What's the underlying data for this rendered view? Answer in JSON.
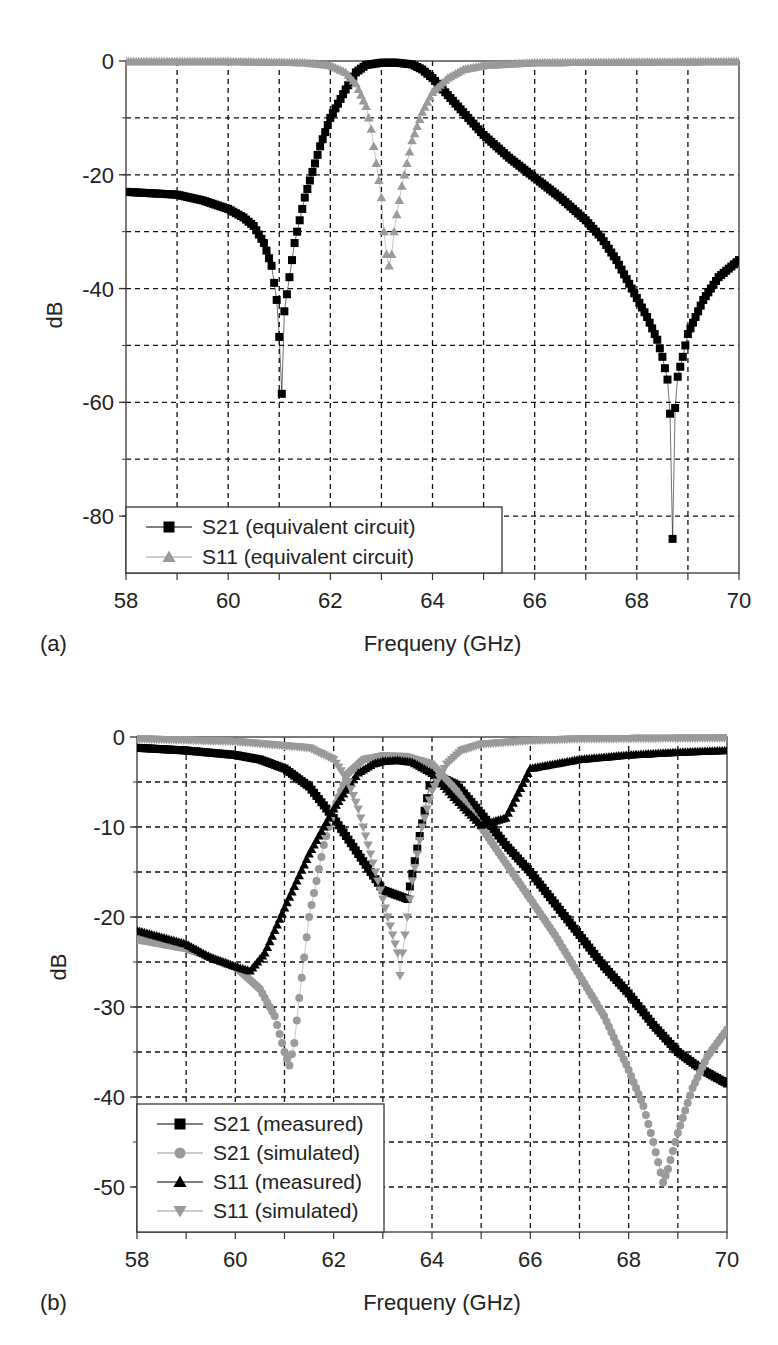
{
  "figures": [
    {
      "panel_label": "(a)",
      "xlabel": "Frequeny (GHz)",
      "ylabel": "dB",
      "legend": [
        {
          "label": "S21 (equivalent circuit)",
          "marker": "square",
          "color": "#000000"
        },
        {
          "label": "S11 (equivalent circuit)",
          "marker": "triangle-up",
          "color": "#9a9a9a"
        }
      ]
    },
    {
      "panel_label": "(b)",
      "xlabel": "Frequeny (GHz)",
      "ylabel": "dB",
      "legend": [
        {
          "label": "S21 (measured)",
          "marker": "square",
          "color": "#000000"
        },
        {
          "label": "S21 (simulated)",
          "marker": "circle",
          "color": "#9a9a9a"
        },
        {
          "label": "S11 (measured)",
          "marker": "triangle-up",
          "color": "#000000"
        },
        {
          "label": "S11 (simulated)",
          "marker": "triangle-down",
          "color": "#9a9a9a"
        }
      ]
    }
  ],
  "chart_data": [
    {
      "type": "scatter",
      "title": "",
      "panel": "(a)",
      "xlabel": "Frequeny (GHz)",
      "ylabel": "dB",
      "xlim": [
        58,
        70
      ],
      "ylim": [
        -90,
        0
      ],
      "xticks": [
        58,
        60,
        62,
        64,
        66,
        68,
        70
      ],
      "yticks": [
        0,
        -20,
        -40,
        -60,
        -80
      ],
      "x_minor_grid_step": 1,
      "y_minor_grid_step": 10,
      "grid": true,
      "legend_position": "lower left",
      "series": [
        {
          "name": "S21 (equivalent circuit)",
          "marker": "square",
          "color": "#000000",
          "x": [
            58,
            59,
            59.5,
            60,
            60.3,
            60.5,
            60.7,
            60.85,
            60.95,
            61.0,
            61.05,
            61.1,
            61.2,
            61.3,
            61.5,
            61.8,
            62.0,
            62.3,
            62.5,
            62.7,
            63.0,
            63.3,
            63.6,
            63.8,
            64.0,
            64.5,
            65.0,
            65.5,
            66.0,
            66.5,
            67.0,
            67.3,
            67.6,
            67.9,
            68.2,
            68.4,
            68.5,
            68.6,
            68.65,
            68.7,
            68.75,
            68.8,
            68.9,
            69.0,
            69.3,
            69.6,
            70.0
          ],
          "y": [
            -23,
            -23.5,
            -24.5,
            -26,
            -27.5,
            -29,
            -32,
            -36,
            -42,
            -48.5,
            -58.5,
            -44,
            -38,
            -32,
            -24,
            -15,
            -10,
            -5,
            -2,
            -0.7,
            -0.3,
            -0.3,
            -0.6,
            -1.5,
            -3,
            -8,
            -13,
            -17,
            -20.5,
            -24,
            -28,
            -31,
            -35,
            -40,
            -45,
            -49,
            -52,
            -56,
            -62,
            -84,
            -61,
            -55.5,
            -52,
            -48,
            -42,
            -38,
            -35
          ]
        },
        {
          "name": "S11 (equivalent circuit)",
          "marker": "triangle-up",
          "color": "#9a9a9a",
          "x": [
            58,
            60,
            61.5,
            62.0,
            62.3,
            62.5,
            62.7,
            62.8,
            62.9,
            63.0,
            63.05,
            63.1,
            63.15,
            63.2,
            63.25,
            63.3,
            63.4,
            63.5,
            63.6,
            63.8,
            64.0,
            64.3,
            64.6,
            65.0,
            66.0,
            70.0
          ],
          "y": [
            -0.1,
            -0.1,
            -0.3,
            -0.8,
            -2,
            -4,
            -8,
            -12,
            -18,
            -24,
            -30,
            -34,
            -36,
            -34,
            -30,
            -27,
            -22,
            -18,
            -14,
            -9,
            -5.5,
            -3,
            -1.5,
            -0.8,
            -0.3,
            -0.1
          ]
        }
      ]
    },
    {
      "type": "scatter",
      "title": "",
      "panel": "(b)",
      "xlabel": "Frequeny (GHz)",
      "ylabel": "dB",
      "xlim": [
        58,
        70
      ],
      "ylim": [
        -55,
        0
      ],
      "xticks": [
        58,
        60,
        62,
        64,
        66,
        68,
        70
      ],
      "yticks": [
        0,
        -10,
        -20,
        -30,
        -40,
        -50
      ],
      "x_minor_grid_step": 1,
      "y_minor_grid_step": 5,
      "grid": true,
      "legend_position": "lower left",
      "series": [
        {
          "name": "S21 (measured)",
          "marker": "square",
          "color": "#000000",
          "x": [
            58,
            59,
            60,
            60.5,
            61,
            61.5,
            62,
            62.5,
            63,
            63.5,
            64,
            64.5,
            65,
            65.5,
            66,
            66.5,
            67,
            67.5,
            68,
            68.5,
            69,
            69.5,
            70
          ],
          "y": [
            -1.2,
            -1.5,
            -2.0,
            -2.5,
            -3.5,
            -5.5,
            -9,
            -13,
            -17,
            -18,
            -4,
            -5.3,
            -8.5,
            -12,
            -15,
            -18.5,
            -22,
            -25.5,
            -28.5,
            -32,
            -35,
            -37,
            -38.5
          ]
        },
        {
          "name": "S21 (simulated)",
          "marker": "circle",
          "color": "#9a9a9a",
          "x": [
            58,
            59,
            60,
            60.5,
            60.8,
            61.0,
            61.1,
            61.2,
            61.3,
            61.5,
            61.8,
            62.0,
            62.3,
            62.6,
            63.0,
            63.5,
            64.0,
            64.5,
            65.0,
            65.5,
            66,
            66.5,
            67,
            67.5,
            68,
            68.3,
            68.5,
            68.7,
            68.8,
            69.0,
            69.3,
            69.6,
            70.0
          ],
          "y": [
            -22.5,
            -23.5,
            -25.5,
            -28,
            -31,
            -35,
            -36.5,
            -34,
            -29,
            -20,
            -12,
            -8,
            -4,
            -2.5,
            -2.1,
            -2.2,
            -3,
            -6,
            -10,
            -14,
            -18,
            -22,
            -26.5,
            -31,
            -37,
            -41,
            -45,
            -49.5,
            -48,
            -44,
            -39,
            -35.5,
            -32.5
          ]
        },
        {
          "name": "S11 (measured)",
          "marker": "triangle-up",
          "color": "#000000",
          "x": [
            58,
            59,
            59.5,
            60,
            60.3,
            60.6,
            61,
            61.5,
            62,
            62.3,
            62.5,
            62.8,
            63,
            63.3,
            63.6,
            64,
            64.5,
            65,
            65.5,
            66,
            67,
            68,
            69,
            70
          ],
          "y": [
            -21.5,
            -23,
            -24.5,
            -25.5,
            -26,
            -24,
            -19,
            -13,
            -8,
            -5.5,
            -4,
            -3,
            -2.7,
            -2.6,
            -2.8,
            -4,
            -7,
            -9.8,
            -9,
            -3.5,
            -2.5,
            -2,
            -1.7,
            -1.5
          ]
        },
        {
          "name": "S11 (simulated)",
          "marker": "triangle-down",
          "color": "#9a9a9a",
          "x": [
            58,
            60,
            61.5,
            62.0,
            62.3,
            62.5,
            62.7,
            62.9,
            63.0,
            63.1,
            63.2,
            63.3,
            63.35,
            63.4,
            63.5,
            63.6,
            63.8,
            64.0,
            64.3,
            64.6,
            65.0,
            66.0,
            67.0,
            70.0
          ],
          "y": [
            -0.2,
            -0.5,
            -1.2,
            -2.5,
            -5,
            -8,
            -12,
            -16,
            -18,
            -20,
            -22,
            -24,
            -26.5,
            -24,
            -20,
            -16,
            -10,
            -6,
            -3,
            -1.5,
            -0.8,
            -0.4,
            -0.2,
            -0.1
          ]
        }
      ]
    }
  ]
}
